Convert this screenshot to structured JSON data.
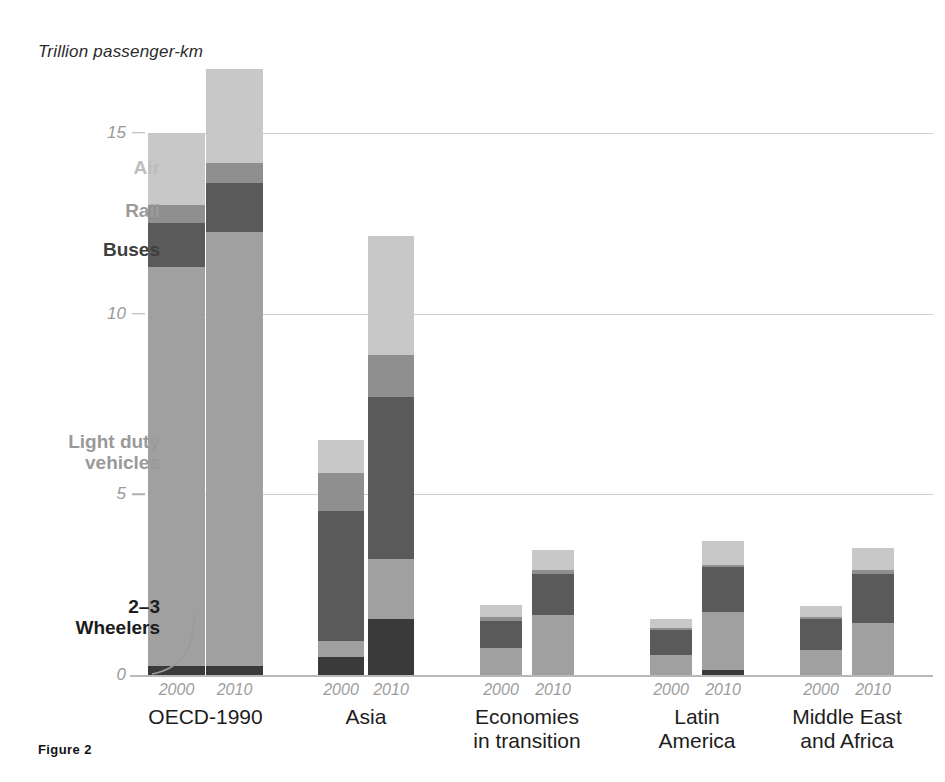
{
  "figure": {
    "caption": "Figure 2",
    "axis_title": "Trillion passenger-km"
  },
  "legend": {
    "air": "Air",
    "rail": "Rail",
    "buses": "Buses",
    "ldv": "Light duty\nvehicles",
    "wheelers": "2–3\nWheelers"
  },
  "colors": {
    "air": "#c8c8c8",
    "rail": "#8f8f8f",
    "buses": "#5a5a5a",
    "ldv": "#a0a0a0",
    "wheelers": "#3a3a3a",
    "gridline": "#cfcfcf",
    "tick_text": "#9a9a9a",
    "background": "#ffffff"
  },
  "groups": {
    "g0": "OECD-1990",
    "g1": "Asia",
    "g2": "Economies\nin transition",
    "g3": "Latin\nAmerica",
    "g4": "Middle East\nand Africa"
  },
  "years": {
    "y2000": "2000",
    "y2010": "2010"
  },
  "yticks": {
    "t0": "0",
    "t5": "5",
    "t10": "10",
    "t15": "15"
  },
  "chart_data": {
    "type": "bar",
    "subtype": "stacked-grouped-bar",
    "title": "",
    "xlabel": "",
    "ylabel": "Trillion passenger-km",
    "ylim": [
      0,
      18
    ],
    "yticks": [
      0,
      5,
      10,
      15
    ],
    "grid": true,
    "legend_position": "in-plot-left-callouts",
    "stack_order_bottom_to_top": [
      "2–3 Wheelers",
      "Light duty vehicles",
      "Buses",
      "Rail",
      "Air"
    ],
    "categories": [
      "OECD-1990",
      "Asia",
      "Economies in transition",
      "Latin America",
      "Middle East and Africa"
    ],
    "subcategories": [
      "2000",
      "2010"
    ],
    "series": [
      {
        "name": "2–3 Wheelers",
        "color": "#3a3a3a",
        "values": {
          "OECD-1990": {
            "2000": 0.25,
            "2010": 0.25
          },
          "Asia": {
            "2000": 0.5,
            "2010": 1.55
          },
          "Economies in transition": {
            "2000": 0.0,
            "2010": 0.0
          },
          "Latin America": {
            "2000": 0.0,
            "2010": 0.15
          },
          "Middle East and Africa": {
            "2000": 0.0,
            "2010": 0.0
          }
        }
      },
      {
        "name": "Light duty vehicles",
        "color": "#a0a0a0",
        "values": {
          "OECD-1990": {
            "2000": 11.05,
            "2010": 12.0
          },
          "Asia": {
            "2000": 0.45,
            "2010": 1.65
          },
          "Economies in transition": {
            "2000": 0.75,
            "2010": 1.65
          },
          "Latin America": {
            "2000": 0.55,
            "2010": 1.6
          },
          "Middle East and Africa": {
            "2000": 0.7,
            "2010": 1.45
          }
        }
      },
      {
        "name": "Buses",
        "color": "#5a5a5a",
        "values": {
          "OECD-1990": {
            "2000": 1.2,
            "2010": 1.35
          },
          "Asia": {
            "2000": 3.6,
            "2010": 4.5
          },
          "Economies in transition": {
            "2000": 0.75,
            "2010": 1.15
          },
          "Latin America": {
            "2000": 0.7,
            "2010": 1.25
          },
          "Middle East and Africa": {
            "2000": 0.85,
            "2010": 1.35
          }
        }
      },
      {
        "name": "Rail",
        "color": "#8f8f8f",
        "values": {
          "OECD-1990": {
            "2000": 0.5,
            "2010": 0.55
          },
          "Asia": {
            "2000": 1.05,
            "2010": 1.15
          },
          "Economies in transition": {
            "2000": 0.1,
            "2010": 0.1
          },
          "Latin America": {
            "2000": 0.05,
            "2010": 0.05
          },
          "Middle East and Africa": {
            "2000": 0.05,
            "2010": 0.1
          }
        }
      },
      {
        "name": "Air",
        "color": "#c8c8c8",
        "values": {
          "OECD-1990": {
            "2000": 2.0,
            "2010": 2.6
          },
          "Asia": {
            "2000": 0.9,
            "2010": 3.3
          },
          "Economies in transition": {
            "2000": 0.35,
            "2010": 0.55
          },
          "Latin America": {
            "2000": 0.25,
            "2010": 0.65
          },
          "Middle East and Africa": {
            "2000": 0.3,
            "2010": 0.6
          }
        }
      }
    ],
    "totals": {
      "OECD-1990": {
        "2000": 15.0,
        "2010": 16.75
      },
      "Asia": {
        "2000": 6.5,
        "2010": 12.15
      },
      "Economies in transition": {
        "2000": 1.95,
        "2010": 3.45
      },
      "Latin America": {
        "2000": 1.55,
        "2010": 3.7
      },
      "Middle East and Africa": {
        "2000": 1.9,
        "2010": 3.5
      }
    }
  }
}
